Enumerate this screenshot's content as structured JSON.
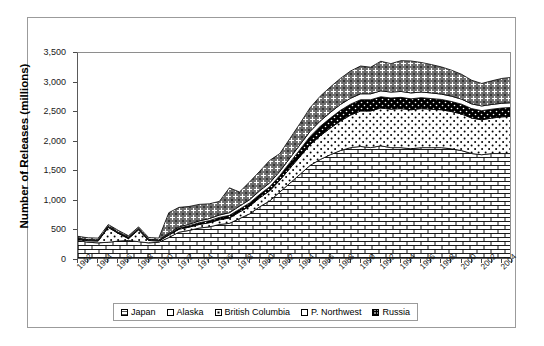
{
  "chart_data": {
    "type": "area",
    "stacked": true,
    "title": "",
    "xlabel": "",
    "ylabel": "Number of Releases (millions)",
    "ylim": [
      0,
      3500
    ],
    "ytick_labels": [
      "0",
      "500",
      "1,000",
      "1,500",
      "2,000",
      "2,500",
      "3,000",
      "3,500"
    ],
    "ytick_values": [
      0,
      500,
      1000,
      1500,
      2000,
      2500,
      3000,
      3500
    ],
    "grid": false,
    "legend_position": "bottom",
    "x": [
      1962,
      1963,
      1964,
      1965,
      1966,
      1967,
      1968,
      1969,
      1970,
      1971,
      1972,
      1973,
      1974,
      1975,
      1976,
      1977,
      1978,
      1979,
      1980,
      1981,
      1982,
      1983,
      1984,
      1985,
      1986,
      1987,
      1988,
      1989,
      1990,
      1991,
      1992,
      1993,
      1994,
      1995,
      1996,
      1997,
      1998,
      1999,
      2000,
      2001,
      2002,
      2003,
      2004,
      2005
    ],
    "xtick_labels": [
      "1962",
      "1964",
      "1966",
      "1968",
      "1970",
      "1972",
      "1974",
      "1976",
      "1978",
      "1980",
      "1982",
      "1984",
      "1986",
      "1988",
      "1990",
      "1992",
      "1994",
      "1996",
      "1998",
      "2000",
      "2002",
      "2004"
    ],
    "series": [
      {
        "name": "Japan",
        "pattern": "brick",
        "values": [
          330,
          300,
          290,
          300,
          320,
          330,
          310,
          290,
          300,
          380,
          470,
          500,
          540,
          560,
          600,
          620,
          700,
          780,
          900,
          1000,
          1150,
          1300,
          1450,
          1600,
          1700,
          1780,
          1850,
          1900,
          1920,
          1900,
          1930,
          1900,
          1900,
          1880,
          1900,
          1900,
          1900,
          1880,
          1850,
          1800,
          1780,
          1800,
          1800,
          1800
        ]
      },
      {
        "name": "Alaska",
        "pattern": "light-dots",
        "values": [
          20,
          25,
          30,
          250,
          130,
          30,
          200,
          40,
          20,
          40,
          50,
          55,
          60,
          70,
          80,
          90,
          110,
          130,
          150,
          170,
          200,
          250,
          300,
          350,
          400,
          450,
          500,
          550,
          600,
          620,
          640,
          650,
          660,
          660,
          660,
          650,
          640,
          630,
          620,
          600,
          590,
          600,
          620,
          630
        ]
      },
      {
        "name": "British Columbia",
        "pattern": "solid-black",
        "values": [
          10,
          10,
          10,
          10,
          10,
          10,
          10,
          10,
          10,
          15,
          20,
          25,
          30,
          35,
          40,
          45,
          50,
          55,
          60,
          70,
          80,
          100,
          120,
          140,
          160,
          170,
          180,
          185,
          190,
          190,
          190,
          190,
          190,
          185,
          185,
          180,
          175,
          170,
          165,
          160,
          155,
          150,
          150,
          150
        ]
      },
      {
        "name": "P. Northwest",
        "pattern": "thin-line",
        "values": [
          10,
          10,
          10,
          10,
          10,
          10,
          10,
          10,
          10,
          15,
          20,
          25,
          30,
          35,
          40,
          45,
          50,
          55,
          60,
          65,
          70,
          75,
          80,
          85,
          90,
          95,
          100,
          100,
          100,
          100,
          100,
          100,
          100,
          100,
          95,
          95,
          90,
          90,
          85,
          80,
          80,
          80,
          80,
          80
        ]
      },
      {
        "name": "Russia",
        "pattern": "cross-hatch",
        "values": [
          30,
          30,
          30,
          30,
          30,
          30,
          30,
          30,
          30,
          350,
          330,
          300,
          280,
          250,
          230,
          420,
          240,
          300,
          330,
          380,
          300,
          330,
          360,
          400,
          420,
          430,
          440,
          460,
          470,
          450,
          500,
          480,
          520,
          540,
          500,
          480,
          460,
          440,
          420,
          400,
          380,
          400,
          420,
          430
        ]
      }
    ]
  },
  "legend": {
    "items": [
      {
        "label": "Japan",
        "pattern": "brick"
      },
      {
        "label": "Alaska",
        "pattern": "light-dots"
      },
      {
        "label": "British Columbia",
        "pattern": "solid-black"
      },
      {
        "label": "P. Northwest",
        "pattern": "thin-line"
      },
      {
        "label": "Russia",
        "pattern": "cross-hatch"
      }
    ]
  }
}
